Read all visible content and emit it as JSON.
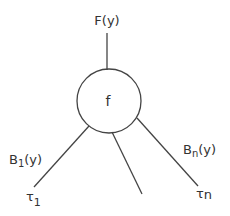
{
  "diagram": {
    "node": {
      "label": "f"
    },
    "top": {
      "label": "F(y)"
    },
    "left_edge": {
      "label_main": "B",
      "label_sub": "1",
      "label_suffix": "(y)"
    },
    "right_edge": {
      "label_main": "B",
      "label_sub": "n",
      "label_suffix": "(y)"
    },
    "left_leaf": {
      "label_main": "τ",
      "label_sub": "1"
    },
    "right_leaf": {
      "label_main": "τ",
      "label_sub": "n"
    },
    "colors": {
      "line": "#444444",
      "text": "#333333",
      "background": "#ffffff"
    }
  }
}
